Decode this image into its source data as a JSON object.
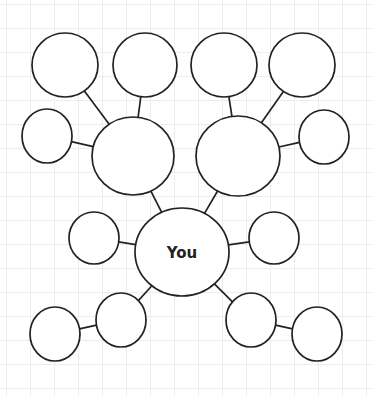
{
  "diagram": {
    "type": "bubble-map",
    "center_label": "You",
    "line_color": "#222222",
    "background": "#ffffff",
    "grid_color": "#ededed",
    "nodes": [
      {
        "id": "center",
        "label": "You",
        "cx": 182,
        "cy": 252,
        "rx": 47,
        "ry": 44
      },
      {
        "id": "hub-left",
        "label": "",
        "cx": 133,
        "cy": 156,
        "rx": 41,
        "ry": 39
      },
      {
        "id": "hub-right",
        "label": "",
        "cx": 238,
        "cy": 156,
        "rx": 42,
        "ry": 40
      },
      {
        "id": "top-1",
        "label": "",
        "cx": 65,
        "cy": 65,
        "rx": 33,
        "ry": 32
      },
      {
        "id": "top-2",
        "label": "",
        "cx": 145,
        "cy": 65,
        "rx": 32,
        "ry": 32
      },
      {
        "id": "top-3",
        "label": "",
        "cx": 224,
        "cy": 65,
        "rx": 33,
        "ry": 32
      },
      {
        "id": "top-4",
        "label": "",
        "cx": 302,
        "cy": 65,
        "rx": 33,
        "ry": 32
      },
      {
        "id": "side-left",
        "label": "",
        "cx": 47,
        "cy": 136,
        "rx": 25,
        "ry": 27
      },
      {
        "id": "side-right",
        "label": "",
        "cx": 324,
        "cy": 137,
        "rx": 25,
        "ry": 27
      },
      {
        "id": "mid-left",
        "label": "",
        "cx": 94,
        "cy": 238,
        "rx": 25,
        "ry": 26
      },
      {
        "id": "mid-right",
        "label": "",
        "cx": 274,
        "cy": 238,
        "rx": 25,
        "ry": 26
      },
      {
        "id": "low-left-inner",
        "label": "",
        "cx": 121,
        "cy": 320,
        "rx": 25,
        "ry": 27
      },
      {
        "id": "low-left-outer",
        "label": "",
        "cx": 55,
        "cy": 334,
        "rx": 25,
        "ry": 27
      },
      {
        "id": "low-right-inner",
        "label": "",
        "cx": 251,
        "cy": 320,
        "rx": 25,
        "ry": 27
      },
      {
        "id": "low-right-outer",
        "label": "",
        "cx": 317,
        "cy": 334,
        "rx": 25,
        "ry": 27
      }
    ],
    "edges": [
      {
        "from": "center",
        "to": "hub-left"
      },
      {
        "from": "center",
        "to": "hub-right"
      },
      {
        "from": "center",
        "to": "mid-left"
      },
      {
        "from": "center",
        "to": "mid-right"
      },
      {
        "from": "center",
        "to": "low-left-inner"
      },
      {
        "from": "center",
        "to": "low-right-inner"
      },
      {
        "from": "hub-left",
        "to": "top-1"
      },
      {
        "from": "hub-left",
        "to": "top-2"
      },
      {
        "from": "hub-left",
        "to": "side-left"
      },
      {
        "from": "hub-right",
        "to": "top-3"
      },
      {
        "from": "hub-right",
        "to": "top-4"
      },
      {
        "from": "hub-right",
        "to": "side-right"
      },
      {
        "from": "low-left-inner",
        "to": "low-left-outer"
      },
      {
        "from": "low-right-inner",
        "to": "low-right-outer"
      }
    ]
  }
}
